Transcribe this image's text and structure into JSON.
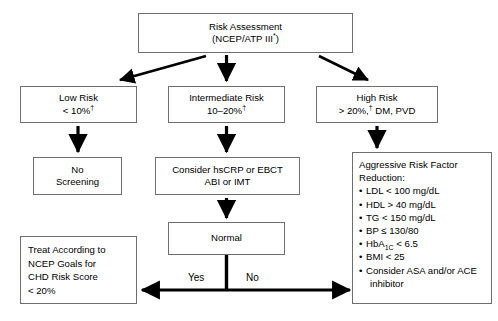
{
  "diagram": {
    "nodes": {
      "risk_assessment": {
        "line1": "Risk Assessment",
        "line2_prefix": "(NCEP/ATP III",
        "line2_sup": "*",
        "line2_suffix": ")"
      },
      "low_risk": {
        "line1": "Low Risk",
        "line2_prefix": "< 10%",
        "line2_sup": "†"
      },
      "intermediate_risk": {
        "line1": "Intermediate Risk",
        "line2_prefix": "10–20%",
        "line2_sup": "†"
      },
      "high_risk": {
        "line1": "High Risk",
        "line2_prefix": "> 20%,",
        "line2_sup": "†",
        "line2_suffix": " DM, PVD"
      },
      "no_screening": {
        "line1": "No",
        "line2": "Screening"
      },
      "consider_tests": {
        "line1": "Consider hsCRP or EBCT",
        "line2": "ABI or IMT"
      },
      "normal": {
        "line1": "Normal"
      },
      "treat_according": {
        "line1": "Treat According to",
        "line2": "NCEP Goals for",
        "line3": "CHD Risk Score",
        "line4": "< 20%"
      },
      "aggressive_reduction": {
        "heading1": "Aggressive Risk Factor",
        "heading2": "Reduction:",
        "bullets": [
          {
            "text": "LDL < 100 mg/dL"
          },
          {
            "text": "HDL > 40 mg/dL"
          },
          {
            "text": "TG < 150 mg/dL"
          },
          {
            "text": "BP ≤ 130/80"
          },
          {
            "text_prefix": "HbA",
            "sub": "1C",
            "text_suffix": " < 6.5"
          },
          {
            "text": "BMI < 25"
          },
          {
            "text": "Consider ASA and/or ACE",
            "continuation": "inhibitor"
          }
        ]
      }
    },
    "edge_labels": {
      "yes": "Yes",
      "no": "No"
    },
    "colors": {
      "stroke": "#000000",
      "box_border": "#6e6e6e",
      "background": "#ffffff",
      "text": "#000000"
    }
  }
}
